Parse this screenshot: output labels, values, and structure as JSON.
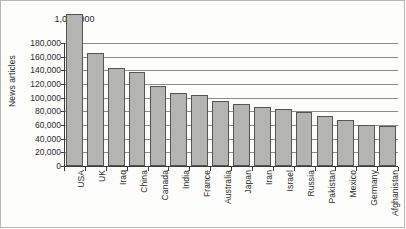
{
  "chart_data": {
    "type": "bar",
    "title": "",
    "xlabel": "",
    "ylabel": "News articles",
    "ylim": [
      0,
      180000
    ],
    "ytick_interval": 20000,
    "grid": true,
    "legend": false,
    "orientation": "vertical",
    "bar_color": "#b4b4b0",
    "bar_edge_color": "#555551",
    "categories": [
      "USA",
      "UK",
      "Iraq",
      "China",
      "Canada",
      "India",
      "France",
      "Australia",
      "Japan",
      "Iran",
      "Israel",
      "Russia",
      "Pakistan",
      "Mexico",
      "Germany",
      "Afghanistan"
    ],
    "values": [
      1027000,
      165000,
      143000,
      137000,
      117000,
      107000,
      104000,
      95000,
      91000,
      86000,
      84000,
      79000,
      73000,
      68000,
      60000,
      58000
    ],
    "ytick_labels": [
      "180,000",
      "160,000",
      "140,000",
      "120,000",
      "100,000",
      "80,000",
      "60,000",
      "40,000",
      "20,000",
      "0"
    ],
    "ytick_values": [
      180000,
      160000,
      140000,
      120000,
      100000,
      80000,
      60000,
      40000,
      20000,
      0
    ],
    "annotations": [
      {
        "target_category": "USA",
        "label": "1,027,000",
        "note": "bar exceeds the axis maximum and is truncated"
      }
    ]
  }
}
